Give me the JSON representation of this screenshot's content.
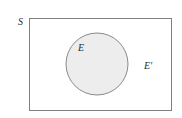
{
  "diagram": {
    "type": "venn-diagram",
    "background_color": "#ffffff",
    "universal_set": {
      "label": "S",
      "shape": "rectangle",
      "fill_color": "#ffffff",
      "stroke_color": "#808080",
      "x": 29,
      "y": 18,
      "width": 143,
      "height": 93,
      "label_x": 18,
      "label_y": 25
    },
    "event_set": {
      "label": "E",
      "shape": "circle",
      "fill_color": "#ededed",
      "stroke_color": "#8a8a8a",
      "cx": 97,
      "cy": 64,
      "r": 31,
      "label_x": 78,
      "label_y": 51
    },
    "complement_set": {
      "label": "E'",
      "region": "inside-rectangle-outside-circle",
      "label_x": 144,
      "label_y": 69
    }
  }
}
